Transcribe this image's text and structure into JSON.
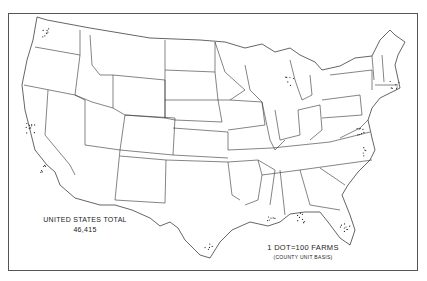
{
  "map": {
    "subject": "Farms, United States (dot distribution)",
    "total_label": "UNITED STATES TOTAL",
    "total_value": "46,415",
    "legend": {
      "title": "1 DOT=100 FARMS",
      "subtitle": "(COUNTY UNIT BASIS)"
    },
    "colors": {
      "background": "#ffffff",
      "lines": "#333333",
      "dots": "#222222",
      "frame": "#555555"
    }
  },
  "dot_clusters": [
    {
      "region": "Puget Sound, WA",
      "x": 47,
      "y": 33,
      "n": 8
    },
    {
      "region": "Central California coast",
      "x": 30,
      "y": 128,
      "n": 10
    },
    {
      "region": "Southern California",
      "x": 45,
      "y": 168,
      "n": 6
    },
    {
      "region": "Florida Atlantic coast",
      "x": 345,
      "y": 228,
      "n": 9
    },
    {
      "region": "Florida Gulf coast",
      "x": 300,
      "y": 218,
      "n": 8
    },
    {
      "region": "Chesapeake / Maryland",
      "x": 362,
      "y": 130,
      "n": 8
    },
    {
      "region": "Long Island / New England",
      "x": 395,
      "y": 85,
      "n": 7
    },
    {
      "region": "Great Lakes Michigan",
      "x": 290,
      "y": 82,
      "n": 6
    },
    {
      "region": "Louisiana coast",
      "x": 272,
      "y": 222,
      "n": 6
    },
    {
      "region": "Texas Gulf coast",
      "x": 210,
      "y": 245,
      "n": 5
    },
    {
      "region": "North Carolina coast",
      "x": 368,
      "y": 152,
      "n": 5
    }
  ]
}
